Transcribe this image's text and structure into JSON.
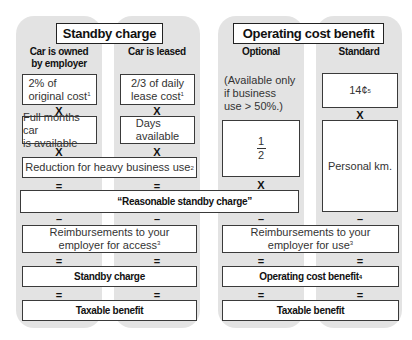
{
  "standby": {
    "title": "Standby charge",
    "columns": [
      {
        "heading_line1": "Car is owned",
        "heading_line2": "by employer",
        "row1_line1": "2% of",
        "row1_line2": "original cost",
        "row1_note": "1",
        "row2_line1": "Full months car",
        "row2_line2": "is available"
      },
      {
        "heading_line1": "Car is leased",
        "row1_line1": "2/3 of daily",
        "row1_line2": "lease cost",
        "row1_note": "1",
        "row2_line1": "Days",
        "row2_line2": "available"
      }
    ],
    "reduction": "Reduction for heavy business use",
    "reduction_note": "2",
    "reasonable": "“Reasonable standby charge”",
    "reimb_line1": "Reimbursements to your",
    "reimb_line2": "employer for access",
    "reimb_note": "3",
    "result": "Standby charge",
    "taxable": "Taxable benefit"
  },
  "operating": {
    "title": "Operating cost benefit",
    "columns": [
      {
        "heading": "Optional",
        "note_line1": "(Available only",
        "note_line2": "if business",
        "note_line3": "use > 50%.)",
        "fraction_num": "1",
        "fraction_den": "2"
      },
      {
        "heading": "Standard",
        "rate": "14¢",
        "rate_note": "5",
        "row2": "Personal km."
      }
    ],
    "reimb_line1": "Reimbursements to your",
    "reimb_line2": "employer for use",
    "reimb_note": "3",
    "result": "Operating cost benefit",
    "result_note": "4",
    "taxable": "Taxable benefit"
  },
  "operators": {
    "times": "X",
    "equals": "=",
    "minus": "–"
  },
  "colors": {
    "panel": "#e3e3e3",
    "box_border": "#3a3a3a",
    "text": "#1a1a1a"
  }
}
